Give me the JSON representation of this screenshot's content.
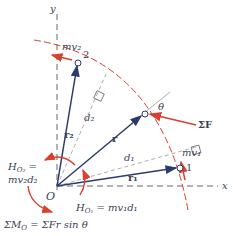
{
  "diagram": {
    "axes": {
      "x_label": "x",
      "y_label": "y",
      "origin_label": "O"
    },
    "points": [
      {
        "id": "1",
        "label": "1",
        "momentum": "mv₁",
        "position_vector": "r₁",
        "distance": "d₁"
      },
      {
        "id": "2",
        "label": "2",
        "momentum": "mv₂",
        "position_vector": "r₂",
        "distance": "d₂"
      },
      {
        "id": "p",
        "position_vector": "r",
        "angle": "θ",
        "force": "ΣF"
      }
    ],
    "equations": {
      "h_o2_line1": "H",
      "h_o2_sub": "O₂",
      "h_o2_eq": " =",
      "h_o2_line2": "mv₂d₂",
      "h_o1_main": "H",
      "h_o1_sub": "O₁",
      "h_o1_rest": " = mv₁d₁",
      "moment_sum": "ΣM",
      "moment_sub": "O",
      "moment_rest": " = ΣFr sin θ"
    },
    "colors": {
      "path": "#d9412e",
      "vector": "#2a3b6e",
      "axis": "#555555",
      "guide": "#888888"
    }
  }
}
